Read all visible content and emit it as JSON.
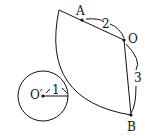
{
  "labels": {
    "A": "A",
    "O": "O",
    "B": "B",
    "Oprime": "O′",
    "r1": "1",
    "r2": "2",
    "r3": "3"
  },
  "colors": {
    "stroke": "#111111",
    "background": "#ffffff"
  }
}
